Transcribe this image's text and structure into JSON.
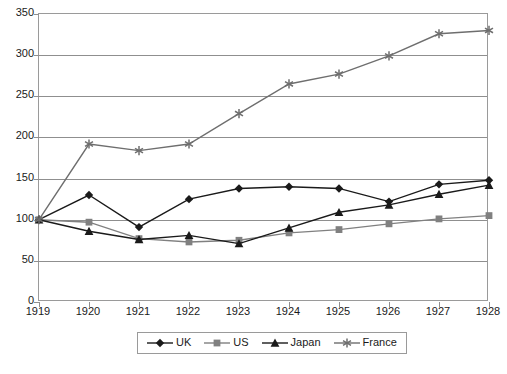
{
  "chart_data": {
    "type": "line",
    "title": "",
    "xlabel": "",
    "ylabel": "",
    "x": [
      1919,
      1920,
      1921,
      1922,
      1923,
      1924,
      1925,
      1926,
      1927,
      1928
    ],
    "categories": [
      "1919",
      "1920",
      "1921",
      "1922",
      "1923",
      "1924",
      "1925",
      "1926",
      "1927",
      "1928"
    ],
    "xtick_labels": [
      "1919",
      "1920",
      "1921",
      "1922",
      "1923",
      "1924",
      "1925",
      "1926",
      "1927",
      "1928"
    ],
    "ytick_labels": [
      "0",
      "50",
      "100",
      "150",
      "200",
      "250",
      "300",
      "350"
    ],
    "yticks": [
      0,
      50,
      100,
      150,
      200,
      250,
      300,
      350
    ],
    "ylim": [
      0,
      350
    ],
    "grid": "horizontal",
    "legend_position": "bottom-center",
    "series": [
      {
        "name": "UK",
        "marker": "diamond",
        "color": "#1a1a1a",
        "values": [
          100,
          130,
          91,
          125,
          138,
          140,
          138,
          122,
          143,
          148
        ]
      },
      {
        "name": "US",
        "marker": "square",
        "color": "#808080",
        "values": [
          100,
          97,
          77,
          73,
          75,
          84,
          88,
          95,
          101,
          105
        ]
      },
      {
        "name": "Japan",
        "marker": "triangle",
        "color": "#1a1a1a",
        "values": [
          100,
          86,
          76,
          81,
          71,
          90,
          109,
          118,
          131,
          142
        ]
      },
      {
        "name": "France",
        "marker": "asterisk",
        "color": "#6e6e6e",
        "values": [
          100,
          192,
          184,
          192,
          229,
          265,
          277,
          299,
          326,
          330
        ]
      }
    ]
  },
  "legend": {
    "items": [
      {
        "label": "UK"
      },
      {
        "label": "US"
      },
      {
        "label": "Japan"
      },
      {
        "label": "France"
      }
    ]
  }
}
